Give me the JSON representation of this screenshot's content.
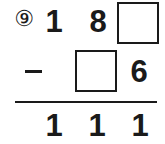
{
  "problem": {
    "number_label": "⑨",
    "operator": "minus",
    "minuend": {
      "digits": [
        "1",
        "8",
        ""
      ],
      "blank_positions": [
        2
      ]
    },
    "subtrahend": {
      "digits": [
        "",
        "",
        "6"
      ],
      "blank_positions": [
        1
      ]
    },
    "result": {
      "digits": [
        "1",
        "1",
        "1"
      ]
    }
  },
  "colors": {
    "ink": "#1a1a1a",
    "background": "#ffffff"
  }
}
